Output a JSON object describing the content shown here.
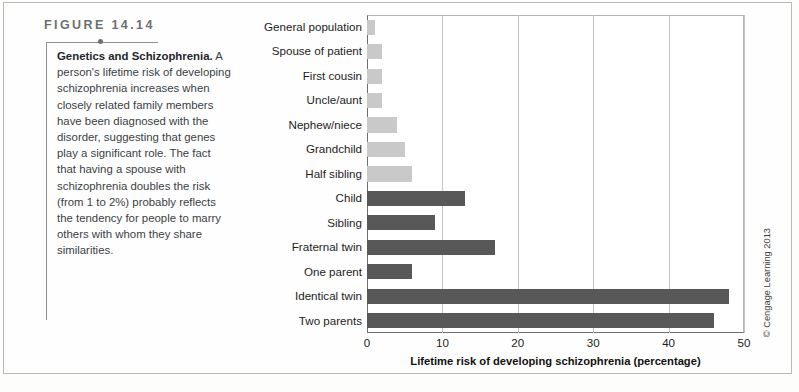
{
  "figure": {
    "label": "FIGURE 14.14",
    "caption_title": "Genetics and Schizophrenia.",
    "caption_body": " A person's lifetime risk of developing schizophrenia increases when closely related family members have been diagnosed with the disorder, suggesting that genes play a significant role. The fact that having a spouse with schizophrenia doubles the risk (from 1 to 2%) probably reflects the tendency for people to marry others with whom they share similarities.",
    "copyright": "© Cengage Learning 2013"
  },
  "colors": {
    "bar_dark": "#585858",
    "bar_light": "#c9c9c9",
    "axis": "#6f6f6f",
    "grid": "#c3c3c3",
    "figure_label": "#6b6f73",
    "frame": "#b9b9b4"
  },
  "chart_data": {
    "type": "bar",
    "orientation": "horizontal",
    "title": "",
    "xlabel": "Lifetime risk of developing schizophrenia (percentage)",
    "ylabel": "",
    "xlim": [
      0,
      50
    ],
    "xticks": [
      0,
      10,
      20,
      30,
      40,
      50
    ],
    "xtick_labels": [
      "0",
      "10",
      "20",
      "30",
      "40",
      "50"
    ],
    "grid": true,
    "legend": "none",
    "categories": [
      "General population",
      "Spouse of patient",
      "First cousin",
      "Uncle/aunt",
      "Nephew/niece",
      "Grandchild",
      "Half sibling",
      "Child",
      "Sibling",
      "Fraternal twin",
      "One parent",
      "Identical twin",
      "Two parents"
    ],
    "values": [
      1,
      2,
      2,
      2,
      4,
      5,
      6,
      13,
      9,
      17,
      6,
      48,
      46
    ],
    "bar_shades": [
      "light",
      "light",
      "light",
      "light",
      "light",
      "light",
      "light",
      "dark",
      "dark",
      "dark",
      "dark",
      "dark",
      "dark"
    ]
  }
}
